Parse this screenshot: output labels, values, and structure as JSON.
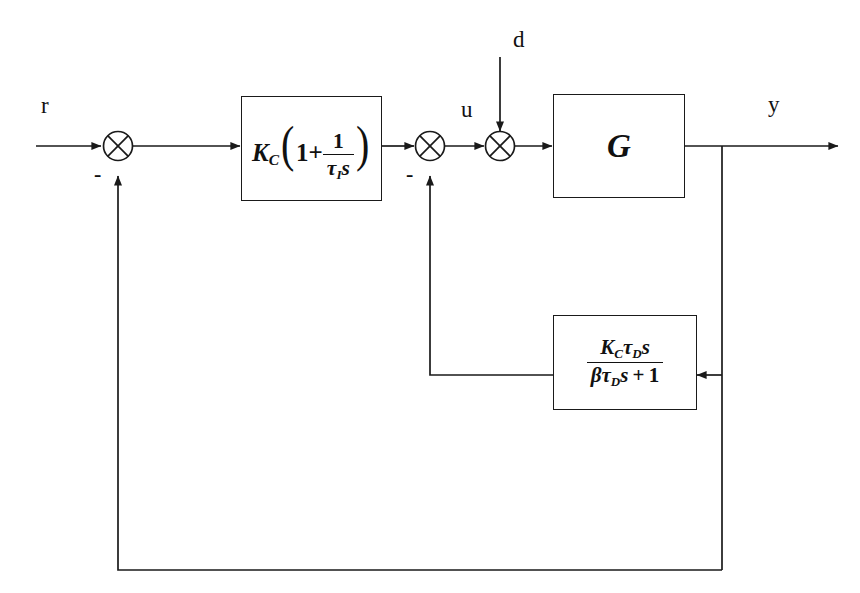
{
  "diagram": {
    "line_color": "#1a1a1a",
    "background": "#ffffff",
    "signals": {
      "reference": "r",
      "disturbance": "d",
      "control": "u",
      "output": "y",
      "negative_sign": "-"
    },
    "blocks": [
      {
        "id": "pi",
        "name": "pi-controller-block",
        "formula_text": "K_C(1 + 1/(tau_I s))",
        "gain": "K",
        "gain_sub": "C",
        "one": "1",
        "plus": "+",
        "num": "1",
        "tau": "τ",
        "tau_sub": "I",
        "s": "s",
        "lparen": "(",
        "rparen": ")"
      },
      {
        "id": "g",
        "name": "process-block",
        "formula_text": "G",
        "letter": "G"
      },
      {
        "id": "d",
        "name": "derivative-feedback-block",
        "formula_text": "K_C tau_D s / (beta tau_D s + 1)",
        "num_gain": "K",
        "num_gain_sub": "C",
        "num_tau": "τ",
        "num_tau_sub": "D",
        "num_s": "s",
        "den_beta": "β",
        "den_tau": "τ",
        "den_tau_sub": "D",
        "den_s": "s",
        "den_plus": "+",
        "den_one": "1"
      }
    ],
    "summing_junctions": [
      {
        "id": "sum1",
        "name": "error-summing-junction",
        "sign": "-"
      },
      {
        "id": "sum2",
        "name": "derivative-summing-junction",
        "sign": "-"
      },
      {
        "id": "sum3",
        "name": "disturbance-summing-junction",
        "sign": ""
      }
    ]
  }
}
